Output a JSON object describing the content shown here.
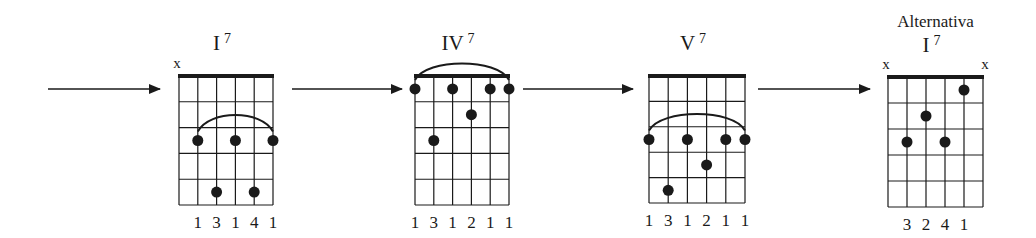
{
  "diagram": {
    "strings": 6,
    "frets_shown": 5,
    "ink_color": "#1a1a1a",
    "arrows": [
      {
        "name": "arrow-into-I7"
      },
      {
        "name": "arrow-I7-to-IV7"
      },
      {
        "name": "arrow-IV7-to-V7"
      },
      {
        "name": "arrow-V7-to-alt-I7"
      }
    ],
    "chords": [
      {
        "id": "I7",
        "caption": "",
        "numeral": "I",
        "superscript": "7",
        "muted": [
          "x",
          "",
          "",
          "",
          "",
          ""
        ],
        "dots": [
          {
            "string": 1,
            "fret": 3
          },
          {
            "string": 3,
            "fret": 3
          },
          {
            "string": 5,
            "fret": 3
          },
          {
            "string": 2,
            "fret": 5
          },
          {
            "string": 4,
            "fret": 5
          }
        ],
        "barre": {
          "fret": 3,
          "from_string": 1,
          "to_string": 5
        },
        "fingering": [
          "1",
          "3",
          "1",
          "4",
          "1"
        ],
        "fingering_start_string": 1
      },
      {
        "id": "IV7",
        "caption": "",
        "numeral": "IV",
        "superscript": "7",
        "muted": [
          "",
          "",
          "",
          "",
          "",
          ""
        ],
        "dots": [
          {
            "string": 0,
            "fret": 1
          },
          {
            "string": 2,
            "fret": 1
          },
          {
            "string": 4,
            "fret": 1
          },
          {
            "string": 5,
            "fret": 1
          },
          {
            "string": 3,
            "fret": 2
          },
          {
            "string": 1,
            "fret": 3
          }
        ],
        "barre": {
          "fret": 1,
          "from_string": 0,
          "to_string": 5
        },
        "fingering": [
          "1",
          "3",
          "1",
          "2",
          "1",
          "1"
        ],
        "fingering_start_string": 0
      },
      {
        "id": "V7",
        "caption": "",
        "numeral": "V",
        "superscript": "7",
        "muted": [
          "",
          "",
          "",
          "",
          "",
          ""
        ],
        "dots": [
          {
            "string": 0,
            "fret": 3
          },
          {
            "string": 2,
            "fret": 3
          },
          {
            "string": 4,
            "fret": 3
          },
          {
            "string": 5,
            "fret": 3
          },
          {
            "string": 3,
            "fret": 4
          },
          {
            "string": 1,
            "fret": 5
          }
        ],
        "barre": {
          "fret": 3,
          "from_string": 0,
          "to_string": 5
        },
        "fingering": [
          "1",
          "3",
          "1",
          "2",
          "1",
          "1"
        ],
        "fingering_start_string": 0
      },
      {
        "id": "alt-I7",
        "caption": "Alternativa",
        "numeral": "I",
        "superscript": "7",
        "muted": [
          "x",
          "",
          "",
          "",
          "",
          "x"
        ],
        "dots": [
          {
            "string": 1,
            "fret": 3
          },
          {
            "string": 2,
            "fret": 2
          },
          {
            "string": 3,
            "fret": 3
          },
          {
            "string": 4,
            "fret": 1
          }
        ],
        "barre": null,
        "fingering": [
          "3",
          "2",
          "4",
          "1"
        ],
        "fingering_start_string": 1
      }
    ]
  }
}
